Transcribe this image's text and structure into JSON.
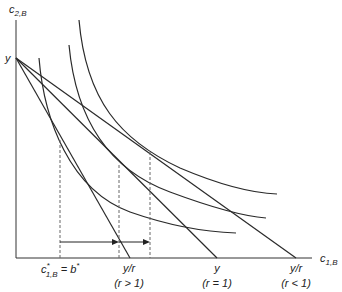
{
  "diagram": {
    "axes": {
      "y_label_main": "c",
      "y_label_sub": "2,B",
      "x_label_main": "c",
      "x_label_sub": "1,B",
      "y_intercept_label": "y"
    },
    "x_ticks": [
      {
        "id": "c1b_star",
        "main": "c",
        "sup": "*",
        "sub": "1,B",
        "rest": " = b",
        "rest_sup": "*"
      },
      {
        "id": "y_over_r_gt1",
        "line1": "y/r",
        "line2": "(r > 1)"
      },
      {
        "id": "y_r_eq1",
        "line1": "y",
        "line2": "(r = 1)"
      },
      {
        "id": "y_over_r_lt1",
        "line1": "y/r",
        "line2": "(r < 1)"
      }
    ],
    "budget_lines": [
      {
        "name": "budget-line-r-gt-1",
        "from": [
          16,
          58
        ],
        "to": [
          130,
          258
        ]
      },
      {
        "name": "budget-line-r-eq-1",
        "from": [
          16,
          58
        ],
        "to": [
          217,
          258
        ]
      },
      {
        "name": "budget-line-r-lt-1",
        "from": [
          16,
          58
        ],
        "to": [
          296,
          258
        ]
      }
    ],
    "indifference_curves": [
      {
        "name": "indifference-curve-low",
        "path": "M39,58 C44,120 70,190 130,212 C170,226 205,232 236,233"
      },
      {
        "name": "indifference-curve-mid",
        "path": "M69,45 C76,120 110,170 170,192 C205,205 240,216 266,218"
      },
      {
        "name": "indifference-curve-high",
        "path": "M79,20 C86,100 120,140 180,168 C220,185 250,193 277,194"
      }
    ],
    "dashed_lines": [
      {
        "name": "dashed-line-c1b-star",
        "x": 60,
        "y1": 140,
        "y2": 258
      },
      {
        "name": "dashed-line-r-gt-1",
        "x": 119,
        "y1": 165,
        "y2": 258
      },
      {
        "name": "dashed-line-r-lt-1",
        "x": 150,
        "y1": 152,
        "y2": 258
      }
    ],
    "arrows": [
      {
        "name": "arrow-to-r-gt-1",
        "x1": 60,
        "x2": 119,
        "y": 242
      },
      {
        "name": "arrow-to-r-lt-1",
        "x1": 119,
        "x2": 150,
        "y": 242
      }
    ]
  }
}
